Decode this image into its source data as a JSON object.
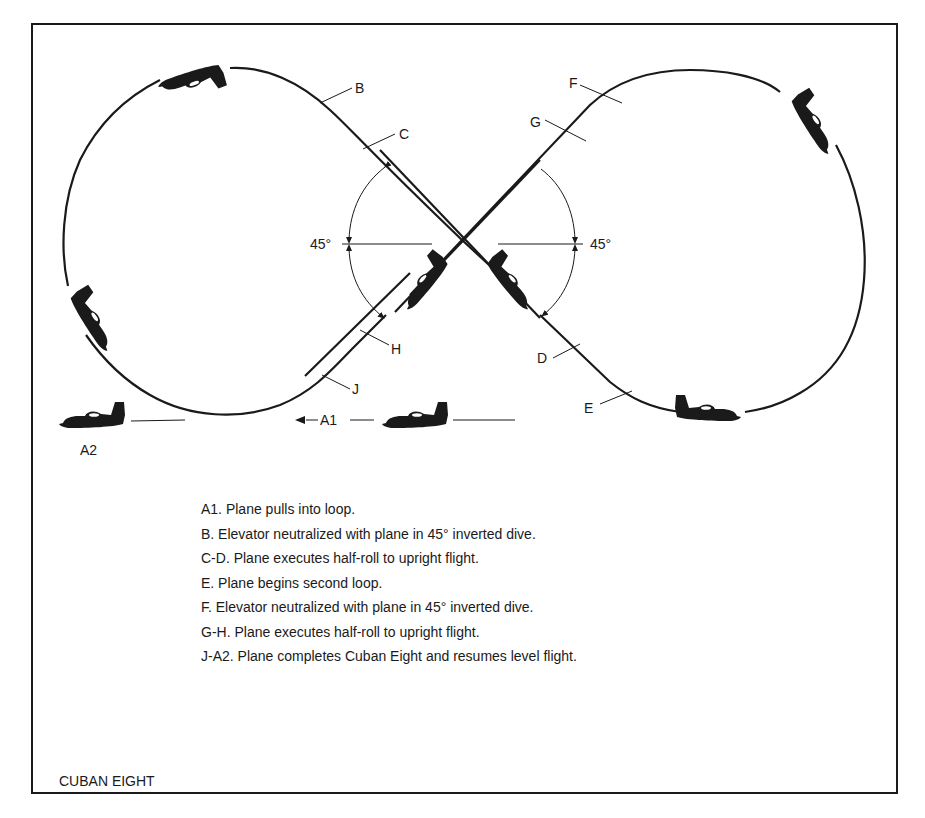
{
  "figure": {
    "title": "CUBAN EIGHT",
    "angle_labels": {
      "left": "45°",
      "right": "45°"
    },
    "point_labels": {
      "A1": "A1",
      "A2": "A2",
      "B": "B",
      "C": "C",
      "D": "D",
      "E": "E",
      "F": "F",
      "G": "G",
      "H": "H",
      "J": "J"
    },
    "colors": {
      "ink": "#1a1a1a",
      "background": "#ffffff"
    }
  },
  "legend": {
    "items": [
      {
        "key": "A1",
        "text": "A1. Plane pulls into loop."
      },
      {
        "key": "B",
        "text": "B. Elevator neutralized with plane in 45° inverted dive."
      },
      {
        "key": "C-D",
        "text": "C-D. Plane executes half-roll to upright flight."
      },
      {
        "key": "E",
        "text": "E. Plane begins second loop."
      },
      {
        "key": "F",
        "text": "F. Elevator neutralized with plane in 45° inverted dive."
      },
      {
        "key": "G-H",
        "text": "G-H. Plane executes half-roll to upright flight."
      },
      {
        "key": "J-A2",
        "text": "J-A2. Plane completes Cuban Eight and resumes level flight."
      }
    ]
  }
}
